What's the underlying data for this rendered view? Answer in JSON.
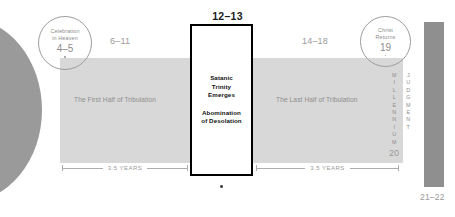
{
  "diagram": {
    "colors": {
      "band": "#d8d8d8",
      "shape_gray": "#9a9a9a",
      "box_border": "#000000",
      "muted_text": "#8d8d8d",
      "dark_text": "#111111"
    },
    "left_shape": {
      "name": "crescent-shape"
    },
    "callouts": [
      {
        "id": "celebration-in-heaven",
        "line1": "Celebration",
        "line2": "in Heaven",
        "reference": "4–5"
      },
      {
        "id": "christ-returns",
        "line1": "Christ",
        "line2": "Returns",
        "reference": "19"
      }
    ],
    "ranges": {
      "first_half": "6–11",
      "center": "12–13",
      "last_half": "14–18",
      "eternity": "21–22",
      "millennium_ref": "20"
    },
    "band_captions": {
      "first": "The First Half of Tribulation",
      "last": "The Last Half of Tribulation"
    },
    "center_box": {
      "block1": [
        "Satanic",
        "Trinity",
        "Emerges"
      ],
      "block2": [
        "Abomination",
        "of Desolation"
      ]
    },
    "measures": {
      "left": "3.5 YEARS",
      "right": "3.5 YEARS"
    },
    "vertical_words": {
      "millennium": "MILLENNIUM",
      "judgment": "JUDGMENT"
    }
  }
}
